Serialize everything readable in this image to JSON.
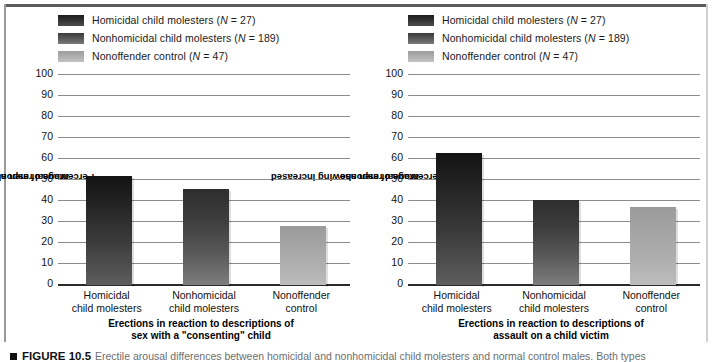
{
  "figure": {
    "caption_bullet": "■",
    "caption_number": "FIGURE 10.5",
    "caption_text": "Erectile arousal differences between homicidal and nonhomicidal child molesters and normal control males. Both types"
  },
  "legend": {
    "items": [
      {
        "label": "Homicidal child molesters (N = 27)",
        "swatch": "dark-gradient-swatch",
        "color": "#1c1c1c"
      },
      {
        "label": "Nonhomicidal child molesters (N = 189)",
        "swatch": "mid-gradient-swatch",
        "color": "#3a3a3a"
      },
      {
        "label": "Nonoffender control (N = 47)",
        "swatch": "light-gradient-swatch",
        "color": "#9d9d9d"
      }
    ]
  },
  "chart_data": [
    {
      "type": "bar",
      "panel": "left",
      "title": "",
      "xlabel_line1": "Erections in reaction to descriptions of",
      "xlabel_line2": "sex with a \"consenting\" child",
      "ylabel_line1": "Percentage of men showing increased",
      "ylabel_line2": "arousal response",
      "categories": [
        "Homicidal child molesters",
        "Nonhomicidal child molesters",
        "Nonoffender control"
      ],
      "category_lines": [
        [
          "Homicidal",
          "child molesters"
        ],
        [
          "Nonhomicidal",
          "child molesters"
        ],
        [
          "Nonoffender",
          "control"
        ]
      ],
      "values": [
        52,
        45.5,
        28
      ],
      "ylim": [
        0,
        100
      ],
      "yticks": [
        100,
        90,
        80,
        70,
        60,
        50,
        40,
        30,
        20,
        10,
        0
      ],
      "grid": true,
      "legend_position": "top"
    },
    {
      "type": "bar",
      "panel": "right",
      "title": "",
      "xlabel_line1": "Erections in reaction to descriptions of",
      "xlabel_line2": "assault on a child victim",
      "ylabel_line1": "Percentage of men showing increased",
      "ylabel_line2": "arousal response",
      "categories": [
        "Homicidal child molesters",
        "Nonhomicidal child molesters",
        "Nonoffender control"
      ],
      "category_lines": [
        [
          "Homicidal",
          "child molesters"
        ],
        [
          "Nonhomicidal",
          "child molesters"
        ],
        [
          "Nonoffender",
          "control"
        ]
      ],
      "values": [
        63,
        40.5,
        37
      ],
      "ylim": [
        0,
        100
      ],
      "yticks": [
        100,
        90,
        80,
        70,
        60,
        50,
        40,
        30,
        20,
        10,
        0
      ],
      "grid": true,
      "legend_position": "top"
    }
  ]
}
